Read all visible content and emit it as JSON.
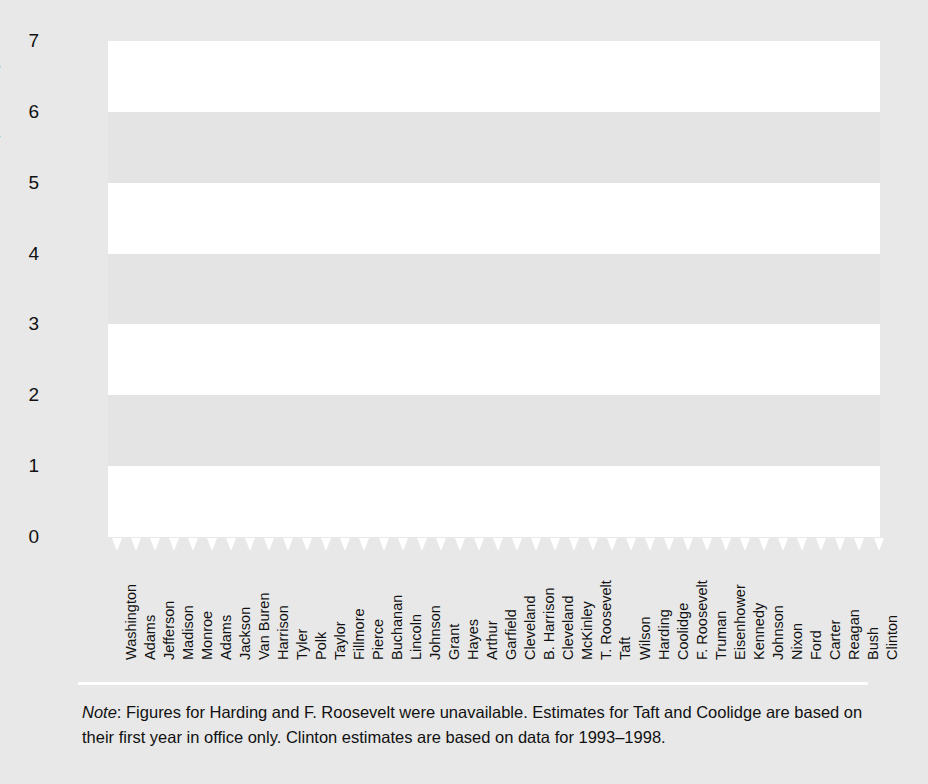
{
  "chart_data": {
    "type": "line",
    "title": "",
    "xlabel": "",
    "ylabel": "Speeches per Year (hundreds)",
    "ylim": [
      0,
      7
    ],
    "yticks": [
      0,
      1,
      2,
      3,
      4,
      5,
      6,
      7
    ],
    "ytick_labels": [
      "0",
      "1",
      "2",
      "3",
      "4",
      "5",
      "6",
      "7"
    ],
    "grid": false,
    "banded_background": true,
    "legend": "none",
    "line_color": "#2b2b2b",
    "categories": [
      "Washington",
      "Adams",
      "Jefferson",
      "Madison",
      "Monroe",
      "Adams",
      "Jackson",
      "Van Buren",
      "Harrison",
      "Tyler",
      "Polk",
      "Taylor",
      "Fillmore",
      "Pierce",
      "Buchanan",
      "Lincoln",
      "Johnson",
      "Grant",
      "Hayes",
      "Arthur",
      "Garfield",
      "Cleveland",
      "B. Harrison",
      "Cleveland",
      "McKinley",
      "T. Roosevelt",
      "Taft",
      "Wilson",
      "Harding",
      "Coolidge",
      "F. Roosevelt",
      "Truman",
      "Eisenhower",
      "Kennedy",
      "Johnson",
      "Nixon",
      "Ford",
      "Carter",
      "Reagan",
      "Bush",
      "Clinton"
    ],
    "values": [
      0.06,
      0.05,
      0.04,
      0.04,
      0.05,
      0.04,
      0.06,
      0.05,
      0.04,
      0.05,
      0.04,
      0.27,
      0.09,
      0.08,
      0.05,
      0.22,
      0.21,
      0.22,
      0.03,
      0.34,
      0.35,
      0.1,
      0.82,
      0.0,
      0.33,
      0.47,
      0.65,
      0.26,
      0.3,
      0.33,
      0.33,
      1.79,
      1.05,
      2.62,
      3.25,
      1.78,
      5.08,
      3.28,
      3.13,
      3.6,
      5.84
    ]
  },
  "note": {
    "prefix": "Note",
    "text": ": Figures for Harding and F. Roosevelt were unavailable. Estimates for Taft and Coolidge are based on their first year in office only. Clinton estimates are based on data for 1993–1998."
  },
  "colors": {
    "figure_background": "#e8e8e8",
    "band_white": "#ffffff",
    "band_grey": "#e4e4e4",
    "line": "#2b2b2b",
    "text": "#111111"
  }
}
